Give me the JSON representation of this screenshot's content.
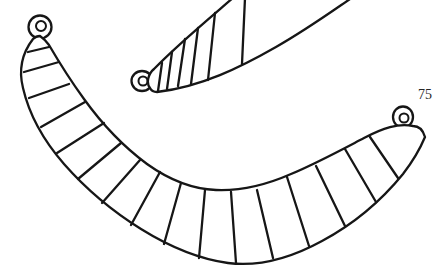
{
  "page": {
    "background": "#ffffff",
    "figure_number": "75"
  },
  "figure": {
    "ink_color": "#161616",
    "objects": [
      {
        "name": "small-striped-pendant-with-suspension-loop",
        "position": "top, partially cut off by top edge"
      },
      {
        "name": "large-striped-crescent-pendant-with-two-suspension-loops",
        "position": "center and bottom"
      }
    ]
  },
  "drawing": {
    "small_pendant": {
      "silhouette": "M 154,69 C 175,47 205,22 234,-3 L 353,-3 C 331,12 306,30 276,47 C 241,67 201,87 157,92 C 153,92 151,90 150,88 C 146,83 148,74 154,69 Z",
      "edges": "M 154,69 C 175,47 205,22 234,-3 M 353,-3 C 331,12 306,30 276,47 C 241,67 201,87 157,92 C 153,92 151,90 150,88 C 146,83 148,74 154,69",
      "ribs": "M 162,63 L 158,91 M 172,52 L 167,89 M 185,39 L 178,86 M 198,28 L 191,84 M 215,13 L 208,80 M 245,-2 L 242,64",
      "loop_outer": "M 131.5,81 a 10.5,10 0 1 0 21,0 a 10.5,10 0 1 0 -21,0",
      "loop_inner": "M 138.5,81 a 4.5,4.5 0 1 0 9,0 a 4.5,4.5 0 1 0 -9,0"
    },
    "large_pendant": {
      "outline": "M 33,39 C 23,52 18,68 23,88 C 29,114 44,141 64,164 C 86,189 112,211 141,229 C 170,247 199,259 228,263 C 259,267 291,258 322,241 C 352,225 381,201 403,174 C 413,161 420,149 425,137 C 423,130 419,126 413,126 C 398,123 383,128 364,138 C 341,150 317,163 291,174 C 266,185 240,191 216,190 C 191,189 168,179 147,164 C 124,147 102,124 84,99 C 68,77 56,57 49,45 C 46,41 43,38 40,36 C 37,36 35,37 33,39 Z",
      "ribs": "M 28,52 L 49,47 M 24,72 L 59,62 M 29,98 L 69,84 M 41,127 L 85,102 M 57,153 L 104,123 M 78,179 L 121,143 M 102,203 L 140,160 M 131,225 L 160,172 M 164,244 L 181,183 M 199,258 L 205,190 M 236,263 L 231,192 M 273,258 L 257,190 M 309,246 L 287,177 M 345,226 L 316,166 M 376,202 L 345,149 M 398,178 L 370,137",
      "loop_left_outer": "M 28.5,27 a 11.5,11.5 0 1 0 23,0 a 11.5,11.5 0 1 0 -23,0",
      "loop_left_inner": "M 36,26 a 5,5 0 1 0 10,0 a 5,5 0 1 0 -10,0",
      "loop_right_outer": "M 393,117 a 10,10.5 0 1 0 20,0 a 10,10.5 0 1 0 -20,0",
      "loop_right_inner": "M 399.5,118 a 4.5,4.5 0 1 0 9,0 a 4.5,4.5 0 1 0 -9,0"
    }
  }
}
